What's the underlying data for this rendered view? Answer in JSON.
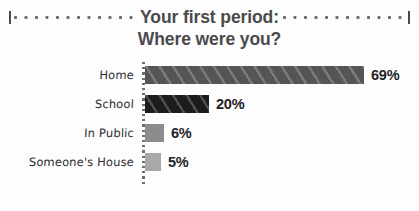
{
  "header": {
    "title_line_1": "Your first period:",
    "title_line_2": "Where were you?",
    "leader_left_icon": "dotted-leader-left",
    "leader_right_icon": "dotted-leader-right",
    "title_color": "#4a4a4c"
  },
  "chart_data": {
    "type": "bar",
    "orientation": "horizontal",
    "title": "Your first period: Where were you?",
    "xlabel": "",
    "ylabel": "",
    "xlim": [
      0,
      100
    ],
    "grid": false,
    "legend": false,
    "axis_style": "dotted-vertical",
    "categories": [
      "Home",
      "School",
      "In Public",
      "Someone's House"
    ],
    "values": [
      69,
      20,
      6,
      5
    ],
    "value_labels": [
      "69%",
      "20%",
      "6%",
      "5%"
    ],
    "bar_colors": [
      "#555558",
      "#1c1c1e",
      "#8c8c8f",
      "#a8a8ab"
    ],
    "bar_textures": [
      "diagonal-hatch",
      "diagonal-hatch",
      "solid",
      "solid"
    ]
  }
}
